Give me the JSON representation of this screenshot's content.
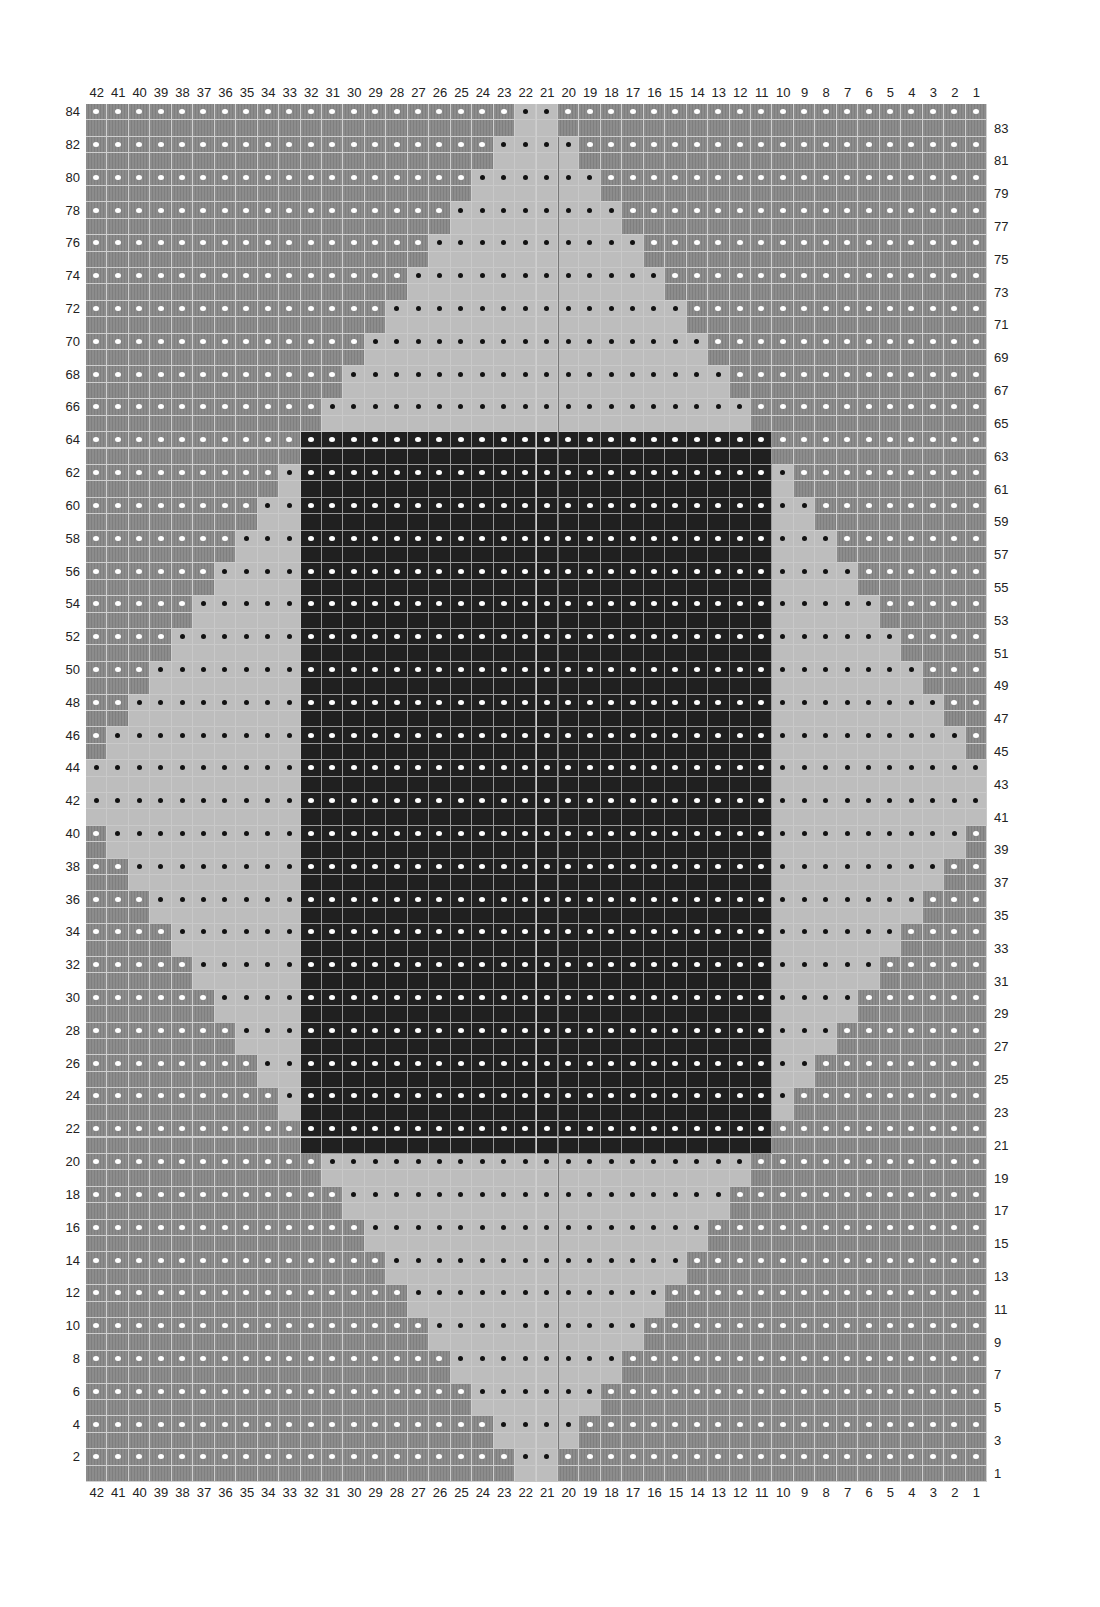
{
  "chart_data": {
    "type": "heatmap",
    "title": "",
    "columns": 42,
    "rows": 84,
    "x_tick_labels": [
      "42",
      "41",
      "40",
      "39",
      "38",
      "37",
      "36",
      "35",
      "34",
      "33",
      "32",
      "31",
      "30",
      "29",
      "28",
      "27",
      "26",
      "25",
      "24",
      "23",
      "22",
      "21",
      "20",
      "19",
      "18",
      "17",
      "16",
      "15",
      "14",
      "13",
      "12",
      "11",
      "10",
      "9",
      "8",
      "7",
      "6",
      "5",
      "4",
      "3",
      "2",
      "1"
    ],
    "y_tick_labels_left": [
      "84",
      "82",
      "80",
      "78",
      "76",
      "74",
      "72",
      "70",
      "68",
      "66",
      "64",
      "62",
      "60",
      "58",
      "56",
      "54",
      "52",
      "50",
      "48",
      "46",
      "44",
      "42",
      "40",
      "38",
      "36",
      "34",
      "32",
      "30",
      "28",
      "26",
      "24",
      "22",
      "20",
      "18",
      "16",
      "14",
      "12",
      "10",
      "8",
      "6",
      "4",
      "2"
    ],
    "y_tick_labels_right": [
      "83",
      "81",
      "79",
      "77",
      "75",
      "73",
      "71",
      "69",
      "67",
      "65",
      "63",
      "61",
      "59",
      "57",
      "55",
      "53",
      "51",
      "49",
      "47",
      "45",
      "43",
      "41",
      "39",
      "37",
      "35",
      "33",
      "31",
      "29",
      "27",
      "25",
      "23",
      "21",
      "19",
      "17",
      "15",
      "13",
      "11",
      "9",
      "7",
      "5",
      "3",
      "1"
    ],
    "legend": {
      "M": {
        "name": "medium gray",
        "color": "#8c8c8c"
      },
      "L": {
        "name": "light gray",
        "color": "#bdbdbd"
      },
      "D": {
        "name": "dark",
        "color": "#202020"
      }
    },
    "dot_rule": "even-numbered rows carry a dot in every stitch: white on medium/dark, black on light",
    "row_encoding": "run-length from column 42 (left) to column 1 (right)",
    "row_patterns": {
      "84": "M20L2M20",
      "83": "M20L2M20",
      "82": "M19L4M19",
      "81": "M19L4M19",
      "80": "M18L6M18",
      "79": "M18L6M18",
      "78": "M17L8M17",
      "77": "M17L8M17",
      "76": "M16L10M16",
      "75": "M16L10M16",
      "74": "M15L12M15",
      "73": "M15L12M15",
      "72": "M14L14M14",
      "71": "M14L14M14",
      "70": "M13L16M13",
      "69": "M13L16M13",
      "68": "M12L18M12",
      "67": "M12L18M12",
      "66": "M11L20M11",
      "65": "M11L20M11",
      "64": "M10D22M10",
      "63": "M10D22M10",
      "62": "M9L1D22L1M9",
      "61": "M9L1D22L1M9",
      "60": "M8L2D22L2M8",
      "59": "M8L2D22L2M8",
      "58": "M7L3D22L3M7",
      "57": "M7L3D22L3M7",
      "56": "M6L4D22L4M6",
      "55": "M6L4D22L4M6",
      "54": "M5L5D22L5M5",
      "53": "M5L5D22L5M5",
      "52": "M4L6D22L6M4",
      "51": "M4L6D22L6M4",
      "50": "M3L7D22L7M3",
      "49": "M3L7D22L7M3",
      "48": "M2L8D22L8M2",
      "47": "M2L8D22L8M2",
      "46": "M1L9D22L9M1",
      "45": "M1L9D22L9M1",
      "44": "L10D22L10",
      "43": "L10D22L10",
      "42": "L10D22L10",
      "41": "L10D22L10",
      "40": "M1L9D22L9M1",
      "39": "M1L9D22L9M1",
      "38": "M2L8D22L8M2",
      "37": "M2L8D22L8M2",
      "36": "M3L7D22L7M3",
      "35": "M3L7D22L7M3",
      "34": "M4L6D22L6M4",
      "33": "M4L6D22L6M4",
      "32": "M5L5D22L5M5",
      "31": "M5L5D22L5M5",
      "30": "M6L4D22L4M6",
      "29": "M6L4D22L4M6",
      "28": "M7L3D22L3M7",
      "27": "M7L3D22L3M7",
      "26": "M8L2D22L2M8",
      "25": "M8L2D22L2M8",
      "24": "M9L1D22L1M9",
      "23": "M9L1D22L1M9",
      "22": "M10D22M10",
      "21": "M10D22M10",
      "20": "M11L20M11",
      "19": "M11L20M11",
      "18": "M12L18M12",
      "17": "M12L18M12",
      "16": "M13L16M13",
      "15": "M13L16M13",
      "14": "M14L14M14",
      "13": "M14L14M14",
      "12": "M15L12M15",
      "11": "M15L12M15",
      "10": "M16L10M16",
      "9": "M16L10M16",
      "8": "M17L8M17",
      "7": "M17L8M17",
      "6": "M18L6M18",
      "5": "M18L6M18",
      "4": "M19L4M19",
      "3": "M19L4M19",
      "2": "M20L2M20",
      "1": "M20L2M20"
    },
    "grid": true,
    "legend_position": "none"
  }
}
